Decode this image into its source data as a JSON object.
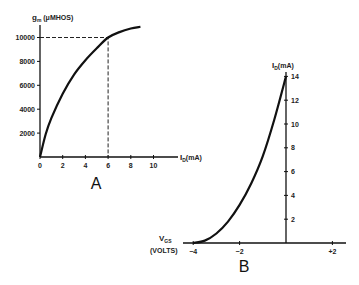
{
  "chart_data": [
    {
      "id": "A",
      "type": "line",
      "panel_label": "A",
      "title": "",
      "xlabel": "I_D (mA)",
      "ylabel": "g_m (μMHOS)",
      "xlim": [
        0,
        11.5
      ],
      "ylim": [
        0,
        11000
      ],
      "xticks": [
        0,
        2,
        4,
        6,
        8,
        10
      ],
      "yticks": [
        2000,
        4000,
        6000,
        8000,
        10000
      ],
      "grid": false,
      "series": [
        {
          "name": "gm vs ID",
          "x": [
            0,
            0.5,
            1,
            2,
            3,
            4,
            5,
            6,
            7,
            8,
            8.85
          ],
          "y": [
            0,
            1900,
            3250,
            5300,
            6900,
            8100,
            9100,
            10000,
            10450,
            10750,
            10900
          ]
        }
      ],
      "annotations": [
        {
          "type": "dashed-guide",
          "x": 6,
          "y": 10000,
          "text": ""
        }
      ]
    },
    {
      "id": "B",
      "type": "line",
      "panel_label": "B",
      "title": "",
      "xlabel": "V_GS (VOLTS)",
      "ylabel": "I_D (mA)",
      "xlim": [
        -4.2,
        2.6
      ],
      "ylim": [
        0,
        14.5
      ],
      "xticks": [
        -4,
        -2,
        2
      ],
      "xtick_labels": [
        "−4",
        "−2",
        "+2"
      ],
      "yticks": [
        2,
        4,
        6,
        8,
        10,
        12,
        14
      ],
      "grid": false,
      "series": [
        {
          "name": "ID vs VGS",
          "x": [
            -4,
            -3.5,
            -3,
            -2.5,
            -2,
            -1.5,
            -1,
            -0.5,
            0
          ],
          "y": [
            0,
            0.2,
            0.8,
            1.8,
            3.2,
            5.0,
            7.3,
            10.4,
            14
          ]
        }
      ]
    }
  ],
  "labels": {
    "a_ylabel_main": "g",
    "a_ylabel_sub": "m",
    "a_ylabel_unit": " (μMHOS)",
    "a_xlabel_main": "I",
    "a_xlabel_sub": "D",
    "a_xlabel_unit": "(mA)",
    "b_ylabel_main": "I",
    "b_ylabel_sub": "D",
    "b_ylabel_unit": "(mA)",
    "b_xlabel_main": "V",
    "b_xlabel_sub": "GS",
    "b_xlabel_unit": "(VOLTS)",
    "panel_a": "A",
    "panel_b": "B"
  }
}
